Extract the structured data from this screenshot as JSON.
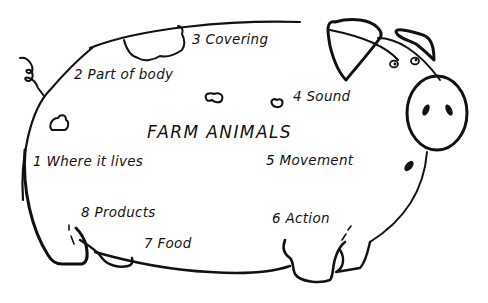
{
  "title": "FARM ANIMALS",
  "categories": [
    {
      "number": "1",
      "label": "Where it lives"
    },
    {
      "number": "2",
      "label": "Part of body"
    },
    {
      "number": "3",
      "label": "Covering"
    },
    {
      "number": "4",
      "label": "Sound"
    },
    {
      "number": "5",
      "label": "Movement"
    },
    {
      "number": "6",
      "label": "Action"
    },
    {
      "number": "7",
      "label": "Food"
    },
    {
      "number": "8",
      "label": "Products"
    }
  ],
  "text": {
    "c1": "1 Where it lives",
    "c2": "2 Part of body",
    "c3": "3 Covering",
    "c4": "4 Sound",
    "c5": "5 Movement",
    "c6": "6 Action",
    "c7": "7 Food",
    "c8": "8 Products"
  },
  "colors": {
    "ink": "#111111",
    "paper": "#ffffff"
  }
}
